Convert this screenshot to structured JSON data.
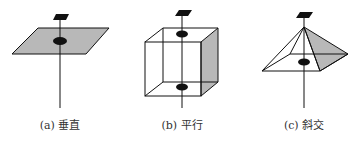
{
  "figures": [
    {
      "id": "a",
      "caption": "(a) 垂直",
      "shape": "plane",
      "center_x": 60
    },
    {
      "id": "b",
      "caption": "(b) 平行",
      "shape": "cube",
      "center_x": 182
    },
    {
      "id": "c",
      "caption": "(c) 斜交",
      "shape": "pyramid",
      "center_x": 304
    }
  ],
  "colors": {
    "line": "#111111",
    "fill_gray": "#b8b8b8",
    "background": "#ffffff"
  }
}
